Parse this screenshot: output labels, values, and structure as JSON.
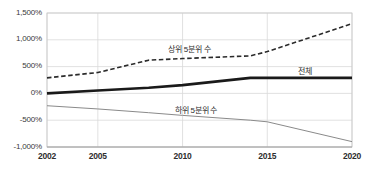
{
  "chart_data": {
    "type": "line",
    "title": "",
    "xlabel": "",
    "ylabel": "",
    "x": [
      2002,
      2005,
      2008,
      2010,
      2014,
      2015,
      2020
    ],
    "xlim": [
      2002,
      2020
    ],
    "ylim": [
      -1000,
      1500
    ],
    "grid": true,
    "legend_position": "inline-annotations",
    "xtick_labels": [
      "2002",
      "2005",
      "2010",
      "2015",
      "2020"
    ],
    "xtick_values": [
      2002,
      2005,
      2010,
      2015,
      2020
    ],
    "ytick_labels": [
      "1,500%",
      "1,000%",
      "500%",
      "0%",
      "-500%",
      "-1,000%"
    ],
    "ytick_values": [
      1500,
      1000,
      500,
      0,
      -500,
      -1000
    ],
    "series": [
      {
        "name": "상위 5분위 수",
        "style": "dashed",
        "color": "#2b2b2b",
        "width": 1.6,
        "label_x": 2010.4,
        "label_y": 830,
        "values": [
          290,
          390,
          620,
          650,
          700,
          780,
          1300
        ]
      },
      {
        "name": "전체",
        "style": "solid-thick",
        "color": "#1a1a1a",
        "width": 2.6,
        "label_x": 2017.2,
        "label_y": 430,
        "values": [
          0,
          55,
          105,
          155,
          290,
          290,
          290
        ]
      },
      {
        "name": "하위 5분위 수",
        "style": "solid-thin",
        "color": "#8a8a8a",
        "width": 1.0,
        "label_x": 2010.8,
        "label_y": -300,
        "values": [
          -230,
          -290,
          -360,
          -410,
          -500,
          -530,
          -900
        ]
      }
    ],
    "axis_color": "#c9c9c9",
    "grid_color": "#d9d9d9",
    "plot_background": "#ffffff"
  }
}
